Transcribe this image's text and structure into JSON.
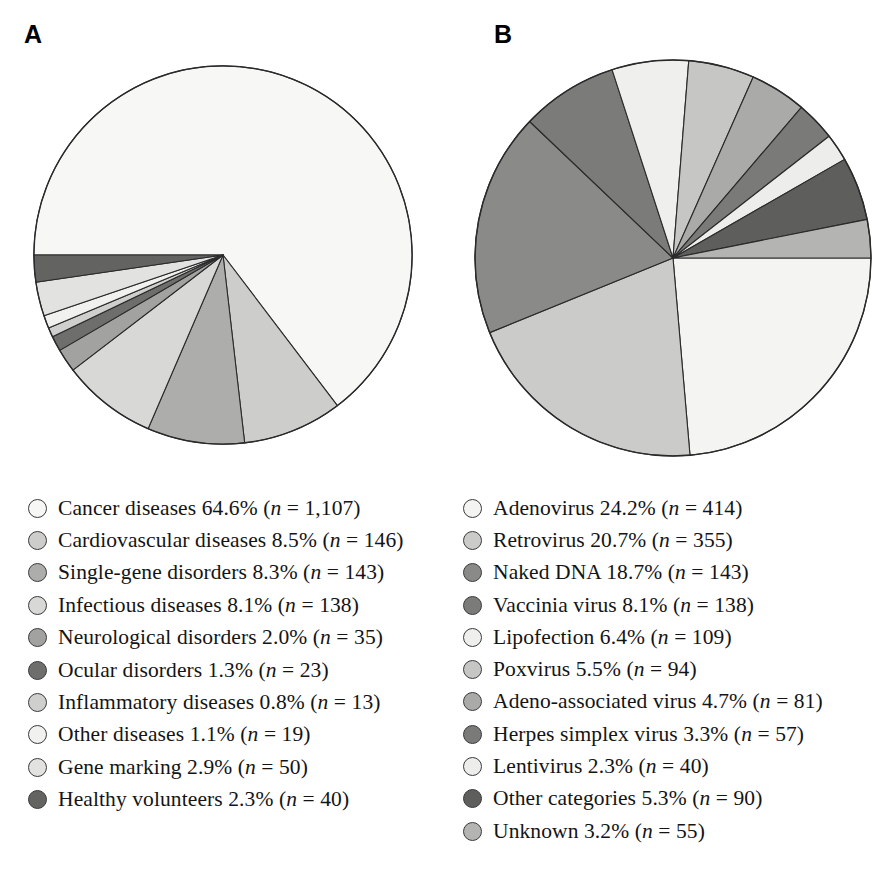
{
  "figure": {
    "panels": [
      {
        "letter": "A",
        "legend_title": "Indications addressed by gene therapy clinical trials",
        "items": [
          {
            "label": "Cancer diseases",
            "percent": "64.6%",
            "n": "1,107",
            "color": "#f7f7f5"
          },
          {
            "label": "Cardiovascular diseases",
            "percent": "8.5%",
            "n": "146",
            "color": "#cdcdcb"
          },
          {
            "label": "Single-gene disorders",
            "percent": "8.3%",
            "n": "143",
            "color": "#adadab"
          },
          {
            "label": "Infectious diseases",
            "percent": "8.1%",
            "n": "138",
            "color": "#d8d8d6"
          },
          {
            "label": "Neurological disorders",
            "percent": "2.0%",
            "n": "35",
            "color": "#a2a2a0"
          },
          {
            "label": "Ocular disorders",
            "percent": "1.3%",
            "n": "23",
            "color": "#6e6e6c"
          },
          {
            "label": "Inflammatory diseases",
            "percent": "0.8%",
            "n": "13",
            "color": "#cfcfcd"
          },
          {
            "label": "Other diseases",
            "percent": "1.1%",
            "n": "19",
            "color": "#f1f1ef"
          },
          {
            "label": "Gene marking",
            "percent": "2.9%",
            "n": "50",
            "color": "#e2e2e0"
          },
          {
            "label": "Healthy volunteers",
            "percent": "2.3%",
            "n": "40",
            "color": "#636361"
          }
        ]
      },
      {
        "letter": "B",
        "legend_title": "Vectors used in gene therapy clinical trials",
        "items": [
          {
            "label": "Adenovirus",
            "percent": "24.2%",
            "n": "414",
            "color": "#f4f4f2"
          },
          {
            "label": "Retrovirus",
            "percent": "20.7%",
            "n": "355",
            "color": "#cbcbc9"
          },
          {
            "label": "Naked DNA",
            "percent": "18.7%",
            "n": "143",
            "color": "#8a8a88"
          },
          {
            "label": "Vaccinia virus",
            "percent": "8.1%",
            "n": "138",
            "color": "#7b7b79"
          },
          {
            "label": "Lipofection",
            "percent": "6.4%",
            "n": "109",
            "color": "#efefed"
          },
          {
            "label": "Poxvirus",
            "percent": "5.5%",
            "n": "94",
            "color": "#c6c6c4"
          },
          {
            "label": "Adeno-associated virus",
            "percent": "4.7%",
            "n": "81",
            "color": "#aaaaa8"
          },
          {
            "label": "Herpes simplex virus",
            "percent": "3.3%",
            "n": "57",
            "color": "#7a7a78"
          },
          {
            "label": "Lentivirus",
            "percent": "2.3%",
            "n": "40",
            "color": "#ededeb"
          },
          {
            "label": "Other categories",
            "percent": "5.3%",
            "n": "90",
            "color": "#5e5e5c"
          },
          {
            "label": "Unknown",
            "percent": "3.2%",
            "n": "55",
            "color": "#b4b4b2"
          }
        ]
      }
    ],
    "style": {
      "slice_stroke": "#2a2a2a",
      "slice_stroke_width": 1.1,
      "background": "#ffffff"
    }
  },
  "chart_data": [
    {
      "type": "pie",
      "title": "A",
      "start_angle_deg": 180,
      "direction": "clockwise",
      "total_n": 1714,
      "labels": [
        "Cancer diseases",
        "Cardiovascular diseases",
        "Single-gene disorders",
        "Infectious diseases",
        "Neurological disorders",
        "Ocular disorders",
        "Inflammatory diseases",
        "Other diseases",
        "Gene marking",
        "Healthy volunteers"
      ],
      "values": [
        64.6,
        8.5,
        8.3,
        8.1,
        2.0,
        1.3,
        0.8,
        1.1,
        2.9,
        2.3
      ],
      "counts": [
        1107,
        146,
        143,
        138,
        35,
        23,
        13,
        19,
        50,
        40
      ],
      "unit": "percent",
      "colors": [
        "#f7f7f5",
        "#cdcdcb",
        "#adadab",
        "#d8d8d6",
        "#a2a2a0",
        "#6e6e6c",
        "#cfcfcd",
        "#f1f1ef",
        "#e2e2e0",
        "#636361"
      ],
      "legend_position": "below"
    },
    {
      "type": "pie",
      "title": "B",
      "start_angle_deg": 0,
      "direction": "clockwise",
      "total_n": 1576,
      "labels": [
        "Adenovirus",
        "Retrovirus",
        "Naked DNA",
        "Vaccinia virus",
        "Lipofection",
        "Poxvirus",
        "Adeno-associated virus",
        "Herpes simplex virus",
        "Lentivirus",
        "Other categories",
        "Unknown"
      ],
      "values": [
        24.2,
        20.7,
        18.7,
        8.1,
        6.4,
        5.5,
        4.7,
        3.3,
        2.3,
        5.3,
        3.2
      ],
      "counts": [
        414,
        355,
        143,
        138,
        109,
        94,
        81,
        57,
        40,
        90,
        55
      ],
      "unit": "percent",
      "colors": [
        "#f4f4f2",
        "#cbcbc9",
        "#8a8a88",
        "#7b7b79",
        "#efefed",
        "#c6c6c4",
        "#aaaaa8",
        "#7a7a78",
        "#ededeb",
        "#5e5e5c",
        "#b4b4b2"
      ],
      "legend_position": "below"
    }
  ]
}
